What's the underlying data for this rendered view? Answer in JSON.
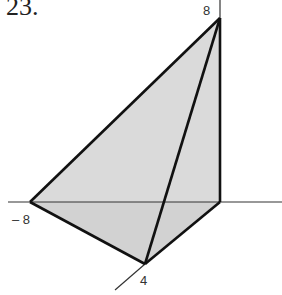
{
  "problem": {
    "number": "23."
  },
  "diagram": {
    "type": "3d-axes-tetrahedron",
    "labels": {
      "z_intercept": "8",
      "x_intercept": "– 8",
      "y_intercept": "4"
    },
    "colors": {
      "fill": "#d9d9d9",
      "edges": "#111111",
      "axes": "#333333"
    }
  }
}
